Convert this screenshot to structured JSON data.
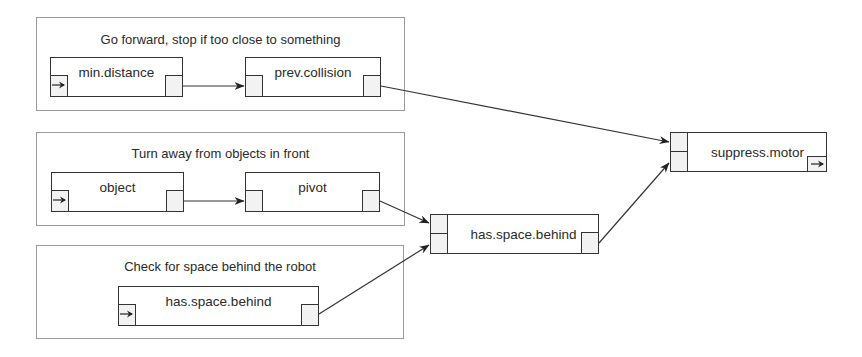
{
  "diagram": {
    "groups": [
      {
        "id": "g1",
        "title": "Go forward, stop if too close to something",
        "nodes": [
          {
            "id": "min_distance",
            "label": "min.distance"
          },
          {
            "id": "prev_collision",
            "label": "prev.collision"
          }
        ]
      },
      {
        "id": "g2",
        "title": "Turn away from objects in front",
        "nodes": [
          {
            "id": "object",
            "label": "object"
          },
          {
            "id": "pivot",
            "label": "pivot"
          }
        ]
      },
      {
        "id": "g3",
        "title": "Check for space behind the robot",
        "nodes": [
          {
            "id": "has_space_behind_inner",
            "label": "has.space.behind"
          }
        ]
      }
    ],
    "free_nodes": [
      {
        "id": "has_space_behind",
        "label": "has.space.behind"
      },
      {
        "id": "suppress_motor",
        "label": "suppress.motor"
      }
    ],
    "edges": [
      {
        "from": "min.distance",
        "to": "prev.collision"
      },
      {
        "from": "prev.collision",
        "to": "suppress.motor (top input)"
      },
      {
        "from": "object",
        "to": "pivot"
      },
      {
        "from": "pivot",
        "to": "has.space.behind (top input)"
      },
      {
        "from": "has.space.behind (group 3)",
        "to": "has.space.behind (bottom input)"
      },
      {
        "from": "has.space.behind",
        "to": "suppress.motor (bottom input)"
      }
    ],
    "colors": {
      "line": "#333333",
      "group_border": "#9a9a9a",
      "port_fill": "#f2f2f2"
    }
  }
}
